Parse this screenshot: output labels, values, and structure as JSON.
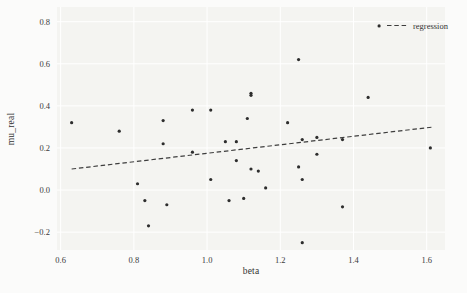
{
  "chart_data": {
    "type": "scatter",
    "title": "",
    "xlabel": "beta",
    "ylabel": "mu_real",
    "xlim": [
      0.59,
      1.65
    ],
    "ylim": [
      -0.285,
      0.87
    ],
    "xtick_labels": [
      "0.6",
      "0.8",
      "1.0",
      "1.2",
      "1.4",
      "1.6"
    ],
    "xtick_values": [
      0.6,
      0.8,
      1.0,
      1.2,
      1.4,
      1.6
    ],
    "ytick_labels": [
      "−0.2",
      "0.0",
      "0.2",
      "0.4",
      "0.6",
      "0.8"
    ],
    "ytick_values": [
      -0.2,
      0.0,
      0.2,
      0.4,
      0.6,
      0.8
    ],
    "grid": true,
    "legend": {
      "position": "upper-right",
      "entries": [
        {
          "label": "regression",
          "style": "dashed-line"
        }
      ]
    },
    "series": [
      {
        "name": "observations",
        "type": "scatter",
        "points": [
          [
            0.63,
            0.32
          ],
          [
            0.76,
            0.28
          ],
          [
            0.81,
            0.03
          ],
          [
            0.83,
            -0.05
          ],
          [
            0.84,
            -0.17
          ],
          [
            0.88,
            0.33
          ],
          [
            0.88,
            0.22
          ],
          [
            0.89,
            -0.07
          ],
          [
            0.96,
            0.38
          ],
          [
            0.96,
            0.18
          ],
          [
            1.01,
            0.38
          ],
          [
            1.01,
            0.05
          ],
          [
            1.05,
            0.23
          ],
          [
            1.06,
            -0.05
          ],
          [
            1.08,
            0.23
          ],
          [
            1.08,
            0.14
          ],
          [
            1.1,
            -0.04
          ],
          [
            1.11,
            0.34
          ],
          [
            1.12,
            0.46
          ],
          [
            1.12,
            0.45
          ],
          [
            1.12,
            0.1
          ],
          [
            1.14,
            0.09
          ],
          [
            1.16,
            0.01
          ],
          [
            1.22,
            0.32
          ],
          [
            1.25,
            0.62
          ],
          [
            1.25,
            0.11
          ],
          [
            1.26,
            0.05
          ],
          [
            1.26,
            -0.25
          ],
          [
            1.26,
            0.24
          ],
          [
            1.3,
            0.25
          ],
          [
            1.3,
            0.17
          ],
          [
            1.37,
            0.24
          ],
          [
            1.37,
            -0.08
          ],
          [
            1.44,
            0.44
          ],
          [
            1.47,
            0.78
          ],
          [
            1.61,
            0.2
          ]
        ]
      }
    ],
    "regression_line": {
      "x": [
        0.63,
        1.62
      ],
      "y": [
        0.1,
        0.3
      ]
    },
    "colors": {
      "point": "#2d2d2d",
      "line": "#3d3d3d",
      "plot_bg": "#f4f4f1",
      "figure_bg": "#fbfbfa",
      "grid": "#ffffff",
      "text": "#333333"
    }
  }
}
